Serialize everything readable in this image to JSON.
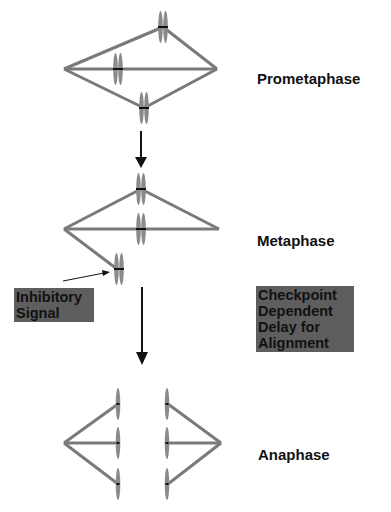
{
  "stages": [
    {
      "label": "Prometaphase"
    },
    {
      "label": "Metaphase"
    },
    {
      "label": "Anaphase"
    }
  ],
  "annotations": {
    "inhibitory": {
      "line1": "Inhibitory",
      "line2": "Signal"
    },
    "checkpoint": {
      "line1": "Checkpoint",
      "line2": "Dependent",
      "line3": "Delay for",
      "line4": "Alignment"
    }
  },
  "colors": {
    "spindle": "#7a7a7a",
    "chromosome": "#8a8a8a",
    "arrow": "#111111",
    "box": "#5e5e5e"
  }
}
